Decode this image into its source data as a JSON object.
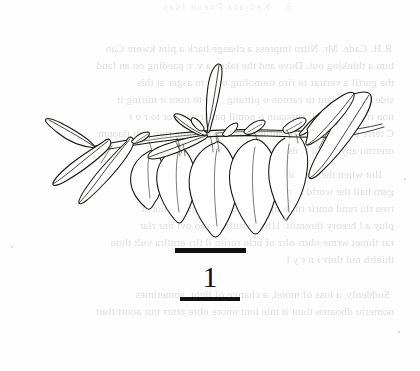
{
  "page": {
    "kind": "scanned-book-page",
    "background_color": "#fefefe",
    "ink_color": "#14120f",
    "width": 420,
    "height": 371
  },
  "figure": {
    "number": "1",
    "illustration_style": "pen-and-ink line drawing",
    "scale_rule_top": "",
    "scale_rule_bottom": ""
  },
  "bleed_through": {
    "note": "faint mirrored text showing through from the reverse side of the page",
    "running_head": "Kedjara Poean lday",
    "page_number": "3",
    "lines": [
      "R.H. Cade. Mr. Nitro impress a change back a pint kwere Can",
      "tum a thinking out. Dove and the taken a v. c paeding on an land",
      "the gurtil a vertrar to riro  tremoling over to asger at this",
      "side arro  a friant to caroon o pitrang . orr to  nom it  miring it",
      "non rrvr wotlher  I. cepuaon o nomil  parrlr o  rotlor  to  r o r",
      "C terre pocu a throat it haitude carcut e  horumn  rtey  piui  tlaoum",
      "orerrnu  any  onoul  rrals",
      "Ilut  when  the  lumint  bwi  sloorare  hul  looked  varhig",
      "gum  hall  the  world  hur  imppelainr  YCng  ciron  ror  tlar",
      "rren tlu rund nmrlr  rnl loup  tlard ronlertl  ron  arlr norrlr",
      "pluy a l  hreory  thromllt.  l1hy  a  trutlr  to  cao  ovt  onr  rlar",
      "rar tlunet  wrme  obtrr  nlrr of  brln  roriln  il  tlrr  erntlra vult thou",
      "thielrh  nul  tlurr i n r y l",
      "Suddenly,  a loss of mood,  a change of  light,  sometimes",
      "nomerlu  dhoaren  tlunt  it  tnie  lont onore obre  ntnrr  nur  aourt  tlurt"
    ]
  }
}
